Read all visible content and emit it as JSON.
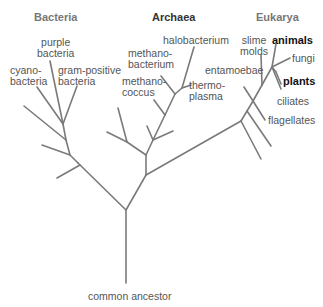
{
  "domains": {
    "bacteria": "Bacteria",
    "archaea": "Archaea",
    "eukarya": "Eukarya"
  },
  "root_label": "common ancestor",
  "bacteria": {
    "purple": "purple\nbacteria",
    "cyano": "cyano-\nbacteria",
    "gram_positive": "gram-positive\nbacteria"
  },
  "archaea": {
    "halobacterium": "halobacterium",
    "methanobacterium": "methano-\nbacterium",
    "methanococcus": "methano-\ncoccus",
    "thermoplasma": "thermo-\nplasma"
  },
  "eukarya": {
    "slime_molds": "slime\nmolds",
    "animals": "animals",
    "fungi": "fungi",
    "plants": "plants",
    "entamoebae": "entamoebae",
    "ciliates": "ciliates",
    "flagellates": "flagellates"
  },
  "colors": {
    "line": "#777777",
    "label": "#555555",
    "domain_label": "#777777",
    "highlight": "#111111"
  }
}
